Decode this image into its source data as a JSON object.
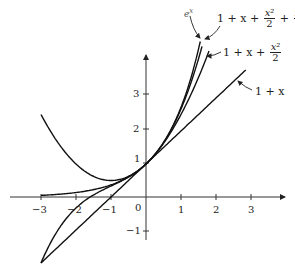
{
  "chart_data": {
    "type": "line",
    "title": "",
    "xlabel": "",
    "ylabel": "",
    "xlim": [
      -3.2,
      3.8
    ],
    "ylim": [
      -2,
      4.2
    ],
    "grid": false,
    "x_ticks": [
      "-3",
      "-2",
      "-1",
      "0",
      "1",
      "2",
      "3"
    ],
    "y_ticks": [
      "-1",
      "1",
      "2",
      "3"
    ],
    "series": [
      {
        "name": "e^x",
        "label": "e",
        "label_sup": "x",
        "domain": [
          -3,
          1.55
        ],
        "expr": "exp"
      },
      {
        "name": "1 + x + x^2/2 + x^3/6",
        "label": "1 + x +",
        "domain": [
          -3,
          1.6
        ],
        "expr": "cubic"
      },
      {
        "name": "1 + x + x^2/2",
        "label": "1 + x +",
        "domain": [
          -3,
          1.8
        ],
        "expr": "quad"
      },
      {
        "name": "1 + x",
        "label": "1 + x",
        "domain": [
          -3,
          2.85
        ],
        "expr": "linear"
      }
    ]
  },
  "labels": {
    "ex_base": "e",
    "ex_sup": "x",
    "cubic_prefix": "1 + x +",
    "cubic_frac1_num": "x²",
    "cubic_frac1_den": "2",
    "cubic_plus": "+",
    "cubic_frac2_num": "x³",
    "cubic_frac2_den": "6",
    "quad_prefix": "1 + x +",
    "quad_frac_num": "x²",
    "quad_frac_den": "2",
    "linear": "1 + x"
  },
  "ticks": {
    "xm3": "−3",
    "xm2": "−2",
    "xm1": "−1",
    "x0": "0",
    "x1": "1",
    "x2": "2",
    "x3": "3",
    "ym1": "−1",
    "y1": "1",
    "y2": "2",
    "y3": "3"
  }
}
